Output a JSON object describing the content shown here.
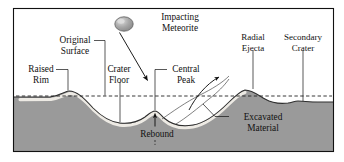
{
  "diagram": {
    "type": "cross-section-diagram",
    "frame": {
      "x": 13,
      "y": 8,
      "width": 321,
      "height": 144
    },
    "colors": {
      "ground_fill": "#9a9a9a",
      "ground_stroke": "#2a2a2a",
      "excavated_band": "#e8e8e4",
      "background": "#ffffff",
      "ink": "#111111",
      "meteorite_fill": "#9d9d9d",
      "meteorite_highlight": "#d8d8d8",
      "dashed_line": "#222222"
    },
    "original_surface_level_y": 96
  },
  "labels": {
    "original_surface": {
      "line1": "Original",
      "line2": "Surface",
      "x": 75,
      "y": 43
    },
    "raised_rim": {
      "line1": "Raised",
      "line2": "Rim",
      "x": 41,
      "y": 72
    },
    "crater_floor": {
      "line1": "Crater",
      "line2": "Floor",
      "x": 119,
      "y": 72
    },
    "impacting_meteorite": {
      "line1": "Impacting",
      "line2": "Meteorite",
      "x": 180,
      "y": 20
    },
    "central_peak": {
      "line1": "Central",
      "line2": "Peak",
      "x": 186,
      "y": 72
    },
    "radial_ejecta": {
      "line1": "Radial",
      "line2": "Ejecta",
      "x": 253,
      "y": 40
    },
    "secondary_crater": {
      "line1": "Secondary",
      "line2": "Crater",
      "x": 303,
      "y": 40
    },
    "rebound": {
      "text": "Rebound",
      "x": 157,
      "y": 131
    },
    "excavated_material": {
      "line1": "Excavated",
      "line2": "Material",
      "x": 263,
      "y": 119
    }
  },
  "features": [
    {
      "name": "raised-rim",
      "description": "uplifted crater rim",
      "peak_x": 68,
      "peak_y": 91
    },
    {
      "name": "crater-floor",
      "description": "deepest excavated floor",
      "x": 120,
      "y": 123
    },
    {
      "name": "central-peak",
      "description": "rebound uplift at crater center",
      "peak_x": 155,
      "peak_y": 111
    },
    {
      "name": "radial-ejecta",
      "description": "ejecta blanket mound",
      "peak_x": 245,
      "peak_y": 90
    },
    {
      "name": "secondary-crater",
      "description": "small depression from ejecta impact",
      "x": 296,
      "y": 101
    },
    {
      "name": "excavated-material",
      "description": "light band of displaced rock beneath surface"
    },
    {
      "name": "impacting-meteorite",
      "description": "incoming bolide",
      "cx": 124,
      "cy": 24,
      "rx": 9,
      "ry": 7
    }
  ],
  "arrows": [
    {
      "name": "impact-trajectory",
      "from": [
        119,
        33
      ],
      "to": [
        148,
        81
      ],
      "style": "straight"
    },
    {
      "name": "ejecta-trajectory",
      "from": [
        190,
        109
      ],
      "to": [
        229,
        74
      ],
      "style": "curved"
    },
    {
      "name": "rebound-uplift",
      "from": [
        155,
        131
      ],
      "to": [
        155,
        114
      ],
      "style": "straight-up"
    }
  ]
}
